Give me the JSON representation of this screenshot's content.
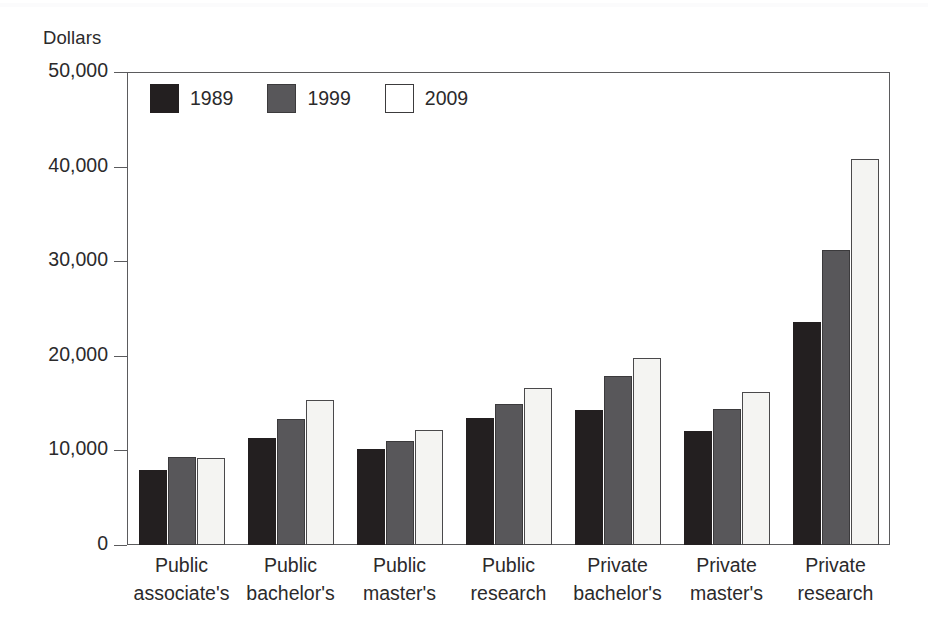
{
  "chart_data": {
    "type": "bar",
    "title": "",
    "ylabel": "Dollars",
    "xlabel": "",
    "ylim": [
      0,
      50000
    ],
    "yticks": [
      "0",
      "10,000",
      "20,000",
      "30,000",
      "40,000",
      "50,000"
    ],
    "ytick_values": [
      0,
      10000,
      20000,
      30000,
      40000,
      50000
    ],
    "grid": false,
    "legend_position": "top-left inside plot",
    "categories": [
      "Public associate's",
      "Public bachelor's",
      "Public master's",
      "Public research",
      "Private bachelor's",
      "Private master's",
      "Private research"
    ],
    "category_lines": [
      [
        "Public",
        "associate's"
      ],
      [
        "Public",
        "bachelor's"
      ],
      [
        "Public",
        "master's"
      ],
      [
        "Public",
        "research"
      ],
      [
        "Private",
        "bachelor's"
      ],
      [
        "Private",
        "master's"
      ],
      [
        "Private",
        "research"
      ]
    ],
    "series": [
      {
        "name": "1989",
        "color": "#231f20",
        "values": [
          7900,
          11300,
          10200,
          13400,
          14300,
          12100,
          23600
        ]
      },
      {
        "name": "1999",
        "color": "#58575a",
        "values": [
          9300,
          13300,
          11000,
          14900,
          17900,
          14400,
          31200
        ]
      },
      {
        "name": "2009",
        "color": "#f4f4f2",
        "values": [
          9200,
          15300,
          12200,
          16600,
          19800,
          16200,
          40800
        ]
      }
    ]
  },
  "legend": {
    "items": [
      {
        "label": "1989",
        "swatch": "y1989"
      },
      {
        "label": "1999",
        "swatch": "y1999"
      },
      {
        "label": "2009",
        "swatch": "y2009"
      }
    ]
  },
  "axis": {
    "y_title": "Dollars"
  }
}
